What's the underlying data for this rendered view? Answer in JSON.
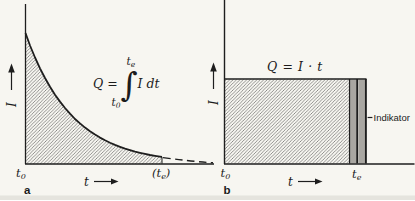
{
  "figure": {
    "background_color": "#f7f6f1",
    "ink_color": "#1e1e1e",
    "hatch_color": "#3d3d3d",
    "indicator_bar_color": "#a9a7a2",
    "scan_edge_color": "#e2e1da"
  },
  "panel_a": {
    "panel_label": "a",
    "y_axis_label": "I",
    "x_axis_label": "t",
    "origin_label": {
      "base": "t",
      "sub": "0"
    },
    "end_label": {
      "open": "(",
      "base": "t",
      "sub": "e",
      "close": ")"
    },
    "formula": {
      "lhs": "Q =",
      "integral_sign": "∫",
      "upper_limit": {
        "base": "t",
        "sub": "e"
      },
      "lower_limit": {
        "base": "t",
        "sub": "0"
      },
      "integrand": "I dt"
    }
  },
  "panel_b": {
    "panel_label": "b",
    "y_axis_label": "I",
    "x_axis_label": "t",
    "origin_label": {
      "base": "t",
      "sub": "0"
    },
    "end_label": {
      "base": "t",
      "sub": "e"
    },
    "formula": "Q = I · t",
    "indicator_label": "Indikator"
  }
}
